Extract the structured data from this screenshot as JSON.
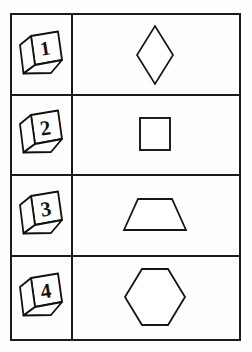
{
  "page": {
    "type": "shapes-worksheet",
    "background_color": "#fefefe",
    "line_color": "#1b1b1b",
    "shape_fill": "#ffffff"
  },
  "table": {
    "columns": [
      "number",
      "shape"
    ],
    "border_color": "#1b1b1b",
    "border_width_px": 2,
    "rows": [
      {
        "index": 1,
        "number_label": "1",
        "number_icon": "numbered-cube-icon",
        "shape_name": "rhombus",
        "shape_label": "Rhombus",
        "shape_sides": 4
      },
      {
        "index": 2,
        "number_label": "2",
        "number_icon": "numbered-cube-icon",
        "shape_name": "square",
        "shape_label": "Square",
        "shape_sides": 4
      },
      {
        "index": 3,
        "number_label": "3",
        "number_icon": "numbered-cube-icon",
        "shape_name": "trapezoid",
        "shape_label": "Trapezoid",
        "shape_sides": 4
      },
      {
        "index": 4,
        "number_label": "4",
        "number_icon": "numbered-cube-icon",
        "shape_name": "hexagon",
        "shape_label": "Hexagon",
        "shape_sides": 6
      }
    ]
  }
}
